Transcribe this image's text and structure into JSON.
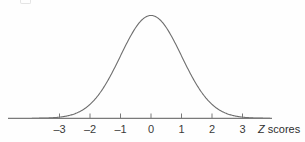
{
  "figure": {
    "background_color": "#fefefe",
    "curve_color": "#6e6e6e",
    "axis_color": "#7a7a7a",
    "text_color": "#3a3a3a"
  },
  "axis": {
    "title": "Z scores",
    "title_variable": "Z",
    "title_rest": " scores"
  },
  "chart_data": {
    "type": "line",
    "title": "",
    "subtitle": "",
    "xlabel": "Z scores",
    "ylabel": "",
    "grid": false,
    "legend": null,
    "legend_position": "none",
    "distribution": "standard normal (Gaussian), mean = 0, standard deviation = 1",
    "xlim": [
      -3.9,
      3.9
    ],
    "ylim": [
      0,
      0.42
    ],
    "xticks": [
      -3,
      -2,
      -1,
      0,
      1,
      2,
      3
    ],
    "xtick_labels": [
      "–3",
      "–2",
      "–1",
      "0",
      "1",
      "2",
      "3"
    ],
    "yticks": [],
    "ytick_labels": [],
    "series": [
      {
        "name": "standard normal density",
        "x": [
          -3.9,
          -3.6,
          -3.3,
          -3.0,
          -2.7,
          -2.4,
          -2.1,
          -1.8,
          -1.5,
          -1.2,
          -0.9,
          -0.6,
          -0.3,
          0.0,
          0.3,
          0.6,
          0.9,
          1.2,
          1.5,
          1.8,
          2.1,
          2.4,
          2.7,
          3.0,
          3.3,
          3.6,
          3.9
        ],
        "y": [
          0.0002,
          0.0006,
          0.0017,
          0.0044,
          0.0104,
          0.0224,
          0.044,
          0.079,
          0.1295,
          0.1942,
          0.2661,
          0.3332,
          0.3814,
          0.3989,
          0.3814,
          0.3332,
          0.2661,
          0.1942,
          0.1295,
          0.079,
          0.044,
          0.0224,
          0.0104,
          0.0044,
          0.0017,
          0.0006,
          0.0002
        ]
      }
    ]
  }
}
